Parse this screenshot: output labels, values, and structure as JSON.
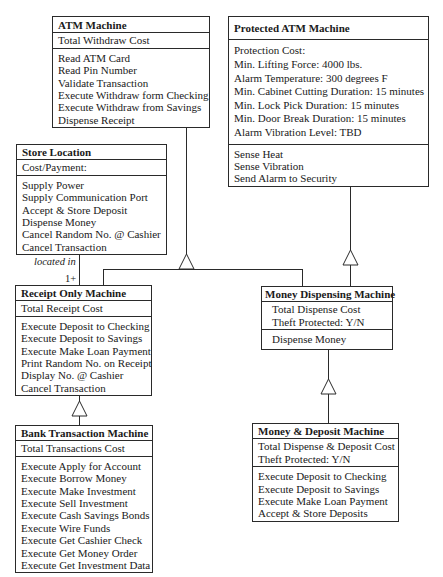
{
  "diagram": {
    "type": "UML class diagram",
    "classes": {
      "atm": {
        "name": "ATM Machine",
        "attributes": [
          "Total Withdraw Cost"
        ],
        "operations": [
          "Read ATM Card",
          "Read Pin Number",
          "Validate Transaction",
          "Execute Withdraw form Checking",
          "Execute Withdraw from Savings",
          "Dispense Receipt"
        ]
      },
      "protected": {
        "name": "Protected ATM Machine",
        "attributes": [
          "Protection Cost:",
          "Min. Lifting Force: 4000 lbs.",
          "Alarm Temperature: 300 degrees F",
          "Min. Cabinet Cutting Duration: 15 minutes",
          "Min. Lock Pick Duration: 15 minutes",
          "Min. Door Break Duration: 15 minutes",
          "Alarm Vibration Level: TBD"
        ],
        "operations": [
          "Sense Heat",
          "Sense Vibration",
          "Send Alarm to Security"
        ]
      },
      "store": {
        "name": "Store Location",
        "attributes": [
          "Cost/Payment:"
        ],
        "operations": [
          "Supply Power",
          "Supply Communication Port",
          "Accept & Store Deposit",
          "Dispense Money",
          "Cancel Random No. @ Cashier",
          "Cancel Transaction"
        ]
      },
      "receipt": {
        "name": "Receipt Only Machine",
        "attributes": [
          "Total Receipt Cost"
        ],
        "operations": [
          "Execute Deposit to Checking",
          "Execute Deposit to Savings",
          "Execute Make Loan Payment",
          "Print Random No. on Receipt",
          "Display No. @ Cashier",
          "Cancel Transaction"
        ]
      },
      "dispensing": {
        "name": "Money Dispensing Machine",
        "attributes": [
          "Total Dispense Cost",
          "Theft Protected: Y/N"
        ],
        "operations": [
          "Dispense Money"
        ]
      },
      "bank": {
        "name": "Bank Transaction Machine",
        "attributes": [
          "Total Transactions Cost"
        ],
        "operations": [
          "Execute Apply for Account",
          "Execute Borrow Money",
          "Execute Make Investment",
          "Execute Sell Investment",
          "Execute Cash Savings Bonds",
          "Execute Wire Funds",
          "Execute Get Cashier Check",
          "Execute Get Money Order",
          "Execute Get Investment Data"
        ]
      },
      "deposit": {
        "name": "Money & Deposit Machine",
        "attributes": [
          "Total Dispense & Deposit Cost",
          "Theft Protected: Y/N"
        ],
        "operations": [
          "Execute Deposit to Checking",
          "Execute Deposit to Savings",
          "Execute Make Loan Payment",
          "Accept & Store Deposits"
        ]
      }
    },
    "relationships": {
      "association": {
        "from": "Store Location",
        "to": "Receipt Only Machine",
        "label": "located in",
        "multiplicity": "1+"
      },
      "generalizations": [
        {
          "child": "Receipt Only Machine",
          "parent": "ATM Machine"
        },
        {
          "child": "Money Dispensing Machine",
          "parent": "ATM Machine"
        },
        {
          "child": "Money Dispensing Machine",
          "parent": "Protected ATM Machine"
        },
        {
          "child": "Bank Transaction Machine",
          "parent": "Receipt Only Machine"
        },
        {
          "child": "Money & Deposit Machine",
          "parent": "Money Dispensing Machine"
        }
      ]
    },
    "colors": {
      "line": "#2a2a2a",
      "background": "#ffffff",
      "text": "#1a1a1a"
    }
  }
}
